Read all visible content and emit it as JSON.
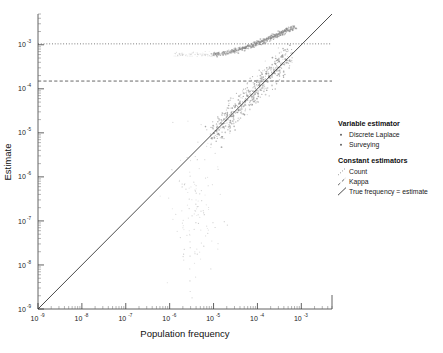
{
  "chart_data": {
    "type": "scatter",
    "title": "",
    "xlabel": "Population frequency",
    "ylabel": "Estimate",
    "xscale": "log",
    "yscale": "log",
    "xlim": [
      1e-09,
      0.005
    ],
    "ylim": [
      1e-09,
      0.005
    ],
    "grid": false,
    "legend_position": "right",
    "x_tick_labels": [
      "10-9",
      "10-8",
      "10-7",
      "10-6",
      "10-5",
      "10-4",
      "10-3"
    ],
    "x_tick_values": [
      1e-09,
      1e-08,
      1e-07,
      1e-06,
      1e-05,
      0.0001,
      0.001
    ],
    "y_tick_labels": [
      "10-9",
      "10-8",
      "10-7",
      "10-6",
      "10-5",
      "10-4",
      "10-3"
    ],
    "y_tick_values": [
      1e-09,
      1e-08,
      1e-07,
      1e-06,
      1e-05,
      0.0001,
      0.001
    ],
    "tick_mantissa": "10",
    "tick_exponents": [
      "-9",
      "-8",
      "-7",
      "-6",
      "-5",
      "-4",
      "-3"
    ],
    "reference_lines": [
      {
        "name": "Count",
        "style": "dotted",
        "orientation": "horizontal",
        "y": 0.00105
      },
      {
        "name": "Kappa",
        "style": "dashed",
        "orientation": "horizontal",
        "y": 0.00015
      },
      {
        "name": "True frequency = estimate",
        "style": "solid",
        "orientation": "diagonal",
        "slope": 1
      }
    ],
    "series": [
      {
        "name": "Discrete Laplace",
        "marker": "point",
        "color": "#8a8a8a",
        "points": [
          [
            1.05e-05,
            0.00062
          ],
          [
            1.2e-05,
            0.0006
          ],
          [
            1.4e-05,
            0.00064
          ],
          [
            1.6e-05,
            0.00061
          ],
          [
            1.9e-05,
            0.00066
          ],
          [
            2.2e-05,
            0.00068
          ],
          [
            2.5e-05,
            0.0007
          ],
          [
            2.8e-05,
            0.00072
          ],
          [
            3.1e-05,
            0.00074
          ],
          [
            3.4e-05,
            0.00075
          ],
          [
            3.8e-05,
            0.00078
          ],
          [
            4.2e-05,
            0.0008
          ],
          [
            4.6e-05,
            0.00082
          ],
          [
            5e-05,
            0.00085
          ],
          [
            5.5e-05,
            0.00087
          ],
          [
            6e-05,
            0.0009
          ],
          [
            6.6e-05,
            0.00093
          ],
          [
            7.2e-05,
            0.00096
          ],
          [
            7.9e-05,
            0.00099
          ],
          [
            8.6e-05,
            0.00102
          ],
          [
            9.4e-05,
            0.00106
          ],
          [
            0.000103,
            0.0011
          ],
          [
            0.000112,
            0.00114
          ],
          [
            0.000122,
            0.00118
          ],
          [
            0.000133,
            0.00122
          ],
          [
            0.000145,
            0.00127
          ],
          [
            0.000158,
            0.00131
          ],
          [
            0.000173,
            0.00136
          ],
          [
            0.000188,
            0.00141
          ],
          [
            0.000205,
            0.00146
          ],
          [
            0.000224,
            0.00152
          ],
          [
            0.000244,
            0.00158
          ],
          [
            0.000266,
            0.00164
          ],
          [
            0.00029,
            0.0017
          ],
          [
            0.000316,
            0.00176
          ],
          [
            0.000345,
            0.00183
          ],
          [
            0.000376,
            0.0019
          ],
          [
            0.00041,
            0.00197
          ],
          [
            0.000447,
            0.00205
          ],
          [
            0.000487,
            0.00213
          ],
          [
            0.000531,
            0.00221
          ],
          [
            0.000579,
            0.0023
          ],
          [
            0.000631,
            0.00239
          ],
          [
            0.000688,
            0.00248
          ]
        ]
      },
      {
        "name": "Surveying",
        "marker": "point",
        "color": "#8a8a8a",
        "points": [
          [
            1e-05,
            9e-06
          ],
          [
            1.2e-05,
            1.3e-05
          ],
          [
            1.5e-05,
            1.1e-05
          ],
          [
            1.8e-05,
            2e-05
          ],
          [
            2.2e-05,
            1.7e-05
          ],
          [
            2.6e-05,
            3e-05
          ],
          [
            3e-05,
            2.4e-05
          ],
          [
            3.6e-05,
            4.2e-05
          ],
          [
            4.2e-05,
            3.5e-05
          ],
          [
            5e-05,
            6e-05
          ],
          [
            6e-05,
            5e-05
          ],
          [
            7e-05,
            8.5e-05
          ],
          [
            8e-05,
            7e-05
          ],
          [
            9.5e-05,
            0.00012
          ],
          [
            0.00011,
            0.0001
          ],
          [
            0.00013,
            0.00017
          ],
          [
            0.00015,
            0.00014
          ],
          [
            0.00018,
            0.00024
          ],
          [
            0.00021,
            0.0002
          ],
          [
            0.00025,
            0.00033
          ],
          [
            0.0003,
            0.00028
          ],
          [
            0.00035,
            0.00046
          ],
          [
            0.00042,
            0.00039
          ],
          [
            0.0005,
            0.00062
          ]
        ]
      }
    ]
  },
  "axes": {
    "x_title": "Population frequency",
    "y_title": "Estimate"
  },
  "legend": {
    "sections": [
      {
        "heading": "Variable estimator",
        "items": [
          {
            "label": "Discrete Laplace",
            "swatch": "point-marker"
          },
          {
            "label": "Surveying",
            "swatch": "point-marker"
          }
        ]
      },
      {
        "heading": "Constant estimators",
        "items": [
          {
            "label": "Count",
            "swatch": "dotted-line"
          },
          {
            "label": "Kappa",
            "swatch": "dashed-line"
          },
          {
            "label": "True frequency = estimate",
            "swatch": "solid-line"
          }
        ]
      }
    ]
  },
  "colors": {
    "point": "#8a8a8a",
    "axis": "#3a3a3a",
    "reference": "#4d4d4d",
    "identity": "#2b2b2b",
    "background": "#ffffff"
  }
}
